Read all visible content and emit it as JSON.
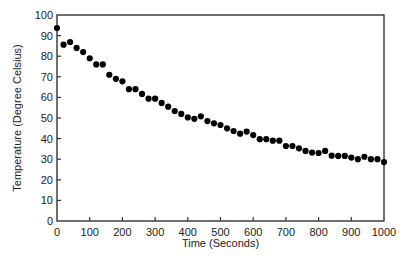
{
  "chart_data": {
    "type": "scatter",
    "title": "",
    "xlabel": "Time (Seconds)",
    "ylabel": "Temperature (Degree Celsius)",
    "xlim": [
      0,
      1000
    ],
    "ylim": [
      0,
      100
    ],
    "xticks": [
      0,
      100,
      200,
      300,
      400,
      500,
      600,
      700,
      800,
      900,
      1000
    ],
    "yticks": [
      0,
      10,
      20,
      30,
      40,
      50,
      60,
      70,
      80,
      90,
      100
    ],
    "grid": false,
    "legend": null,
    "marker_color": "#000000",
    "series": [
      {
        "name": "Temperature",
        "x": [
          0,
          20,
          40,
          60,
          80,
          100,
          120,
          140,
          160,
          180,
          200,
          220,
          240,
          260,
          280,
          300,
          320,
          340,
          360,
          380,
          400,
          420,
          440,
          460,
          480,
          500,
          520,
          540,
          560,
          580,
          600,
          620,
          640,
          660,
          680,
          700,
          720,
          740,
          760,
          780,
          800,
          820,
          840,
          860,
          880,
          900,
          920,
          940,
          960,
          980,
          1000
        ],
        "y": [
          93.7,
          85.6,
          86.9,
          84,
          82,
          79,
          76,
          76,
          71,
          69,
          67.8,
          64,
          64,
          61.7,
          59.4,
          59.4,
          57.3,
          55.5,
          53.4,
          52,
          50.3,
          49.6,
          50.8,
          48.5,
          47.4,
          46.6,
          45,
          43.7,
          42.4,
          43.4,
          41.7,
          39.7,
          39.7,
          39,
          39,
          36.4,
          36.4,
          35.3,
          34,
          33.2,
          33,
          34,
          31.7,
          31.6,
          31.6,
          30.8,
          30,
          31.2,
          30,
          30,
          28.6
        ]
      }
    ]
  }
}
